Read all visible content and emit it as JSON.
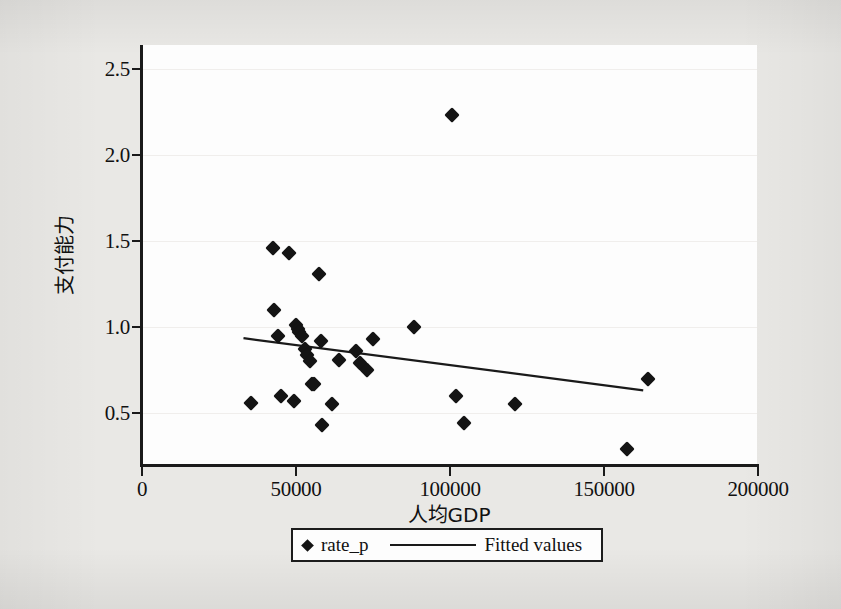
{
  "chart_data": {
    "type": "scatter",
    "title": "",
    "xlabel": "人均GDP",
    "ylabel": "支付能力",
    "xlim": [
      0,
      200000
    ],
    "ylim": [
      0.2,
      2.6
    ],
    "grid": true,
    "grid_axis": "y",
    "legend_position": "below-center",
    "xticks": [
      0,
      50000,
      100000,
      150000,
      200000
    ],
    "xtick_labels": [
      "0",
      "50000",
      "100000",
      "150000",
      "200000"
    ],
    "yticks": [
      0.5,
      1.0,
      1.5,
      2.0,
      2.5
    ],
    "ytick_labels": [
      "0.5",
      "1.0",
      "1.5",
      "2.0",
      "2.5"
    ],
    "series": [
      {
        "name": "rate_p",
        "type": "scatter",
        "marker": "diamond",
        "color": "#141414",
        "points": [
          {
            "x": 35600,
            "y": 0.56
          },
          {
            "x": 42600,
            "y": 1.46
          },
          {
            "x": 43000,
            "y": 1.1
          },
          {
            "x": 44200,
            "y": 0.95
          },
          {
            "x": 45200,
            "y": 0.6
          },
          {
            "x": 47900,
            "y": 1.43
          },
          {
            "x": 49500,
            "y": 0.57
          },
          {
            "x": 50200,
            "y": 1.01
          },
          {
            "x": 50600,
            "y": 0.99
          },
          {
            "x": 51200,
            "y": 0.97
          },
          {
            "x": 52000,
            "y": 0.95
          },
          {
            "x": 53000,
            "y": 0.87
          },
          {
            "x": 53800,
            "y": 0.84
          },
          {
            "x": 54600,
            "y": 0.8
          },
          {
            "x": 55300,
            "y": 0.67
          },
          {
            "x": 56000,
            "y": 0.67
          },
          {
            "x": 57600,
            "y": 1.31
          },
          {
            "x": 58200,
            "y": 0.92
          },
          {
            "x": 58600,
            "y": 0.43
          },
          {
            "x": 61700,
            "y": 0.55
          },
          {
            "x": 64200,
            "y": 0.81
          },
          {
            "x": 69500,
            "y": 0.86
          },
          {
            "x": 70800,
            "y": 0.79
          },
          {
            "x": 73100,
            "y": 0.75
          },
          {
            "x": 75200,
            "y": 0.93
          },
          {
            "x": 88300,
            "y": 1.0
          },
          {
            "x": 100800,
            "y": 2.23
          },
          {
            "x": 102100,
            "y": 0.6
          },
          {
            "x": 104800,
            "y": 0.44
          },
          {
            "x": 121300,
            "y": 0.55
          },
          {
            "x": 157700,
            "y": 0.29
          },
          {
            "x": 164600,
            "y": 0.7
          }
        ]
      },
      {
        "name": "Fitted values",
        "type": "line",
        "color": "#1a1a1a",
        "x_start": 33000,
        "y_start": 0.935,
        "x_end": 163000,
        "y_end": 0.632
      }
    ],
    "legend": [
      {
        "label": "rate_p",
        "marker": "diamond"
      },
      {
        "label": "Fitted values",
        "marker": "line"
      }
    ]
  },
  "axes": {
    "y_axis_title": "支付能力",
    "x_axis_title": "人均GDP"
  }
}
